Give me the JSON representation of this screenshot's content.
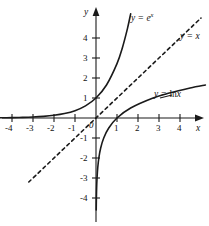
{
  "chart_data": {
    "type": "line",
    "title": "",
    "xlabel": "x",
    "ylabel": "y",
    "xlim": [
      -4.6,
      5.2
    ],
    "ylim": [
      -5.4,
      5.4
    ],
    "grid": false,
    "legend_position": "inline-curve-labels",
    "x_ticks": [
      "-4",
      "-3",
      "-2",
      "-1",
      "1",
      "2",
      "3",
      "4"
    ],
    "y_ticks": [
      "4",
      "3",
      "2",
      "1",
      "-1",
      "-2",
      "-3",
      "-4"
    ],
    "origin_label": "0",
    "series": [
      {
        "name": "y = e^x",
        "label": "y = e",
        "label_exponent": "x",
        "style": "solid",
        "color": "#1a1a1a",
        "points": [
          [
            -4.6,
            0.01
          ],
          [
            -4.0,
            0.018
          ],
          [
            -3.5,
            0.03
          ],
          [
            -3.0,
            0.05
          ],
          [
            -2.5,
            0.082
          ],
          [
            -2.0,
            0.135
          ],
          [
            -1.5,
            0.223
          ],
          [
            -1.0,
            0.368
          ],
          [
            -0.5,
            0.607
          ],
          [
            0.0,
            1.0
          ],
          [
            0.5,
            1.649
          ],
          [
            1.0,
            2.718
          ],
          [
            1.25,
            3.49
          ],
          [
            1.5,
            4.482
          ],
          [
            1.65,
            5.207
          ]
        ]
      },
      {
        "name": "y = x",
        "label": "y = x",
        "style": "dashed",
        "color": "#1a1a1a",
        "points": [
          [
            -3.2,
            -3.2
          ],
          [
            5.0,
            5.0
          ]
        ]
      },
      {
        "name": "y = ln x",
        "label": "y = ln",
        "label_upright": "ln",
        "style": "solid",
        "color": "#1a1a1a",
        "points": [
          [
            0.01,
            -4.6
          ],
          [
            0.018,
            -4.0
          ],
          [
            0.03,
            -3.5
          ],
          [
            0.05,
            -3.0
          ],
          [
            0.082,
            -2.5
          ],
          [
            0.135,
            -2.0
          ],
          [
            0.223,
            -1.5
          ],
          [
            0.368,
            -1.0
          ],
          [
            0.607,
            -0.5
          ],
          [
            1.0,
            0.0
          ],
          [
            1.649,
            0.5
          ],
          [
            2.718,
            1.0
          ],
          [
            3.49,
            1.25
          ],
          [
            4.482,
            1.5
          ],
          [
            5.207,
            1.65
          ]
        ]
      }
    ]
  },
  "labels": {
    "exp_prefix": "y = e",
    "exp_exponent": "x",
    "identity": "y = x",
    "ln_prefix": "y = ",
    "ln_fn": "ln",
    "ln_arg": "x",
    "axis_x": "x",
    "axis_y": "y",
    "origin": "0"
  },
  "ticks": {
    "x_negative": [
      "-4",
      "-3",
      "-2",
      "-1"
    ],
    "x_positive": [
      "1",
      "2",
      "3",
      "4"
    ],
    "y_positive": [
      "4",
      "3",
      "2",
      "1"
    ],
    "y_negative": [
      "-1",
      "-2",
      "-3",
      "-4"
    ]
  },
  "colors": {
    "background": "#ffffff",
    "ink": "#1a1a1a",
    "text": "#111111"
  }
}
